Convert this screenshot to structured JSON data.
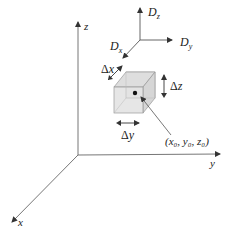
{
  "diagram": {
    "axes": {
      "x_label": "x",
      "y_label": "y",
      "z_label": "z"
    },
    "dispersion": {
      "dx_label": "D",
      "dx_sub": "x",
      "dy_label": "D",
      "dy_sub": "y",
      "dz_label": "D",
      "dz_sub": "z"
    },
    "element": {
      "delta_x": "Δx",
      "delta_y": "Δy",
      "delta_z": "Δz",
      "point_label": "(x₀, y₀, z₀)"
    },
    "colors": {
      "line": "#555555",
      "cube_fill": "#e4e4e4",
      "cube_edge": "#9a9a9a",
      "dot": "#111111"
    }
  }
}
